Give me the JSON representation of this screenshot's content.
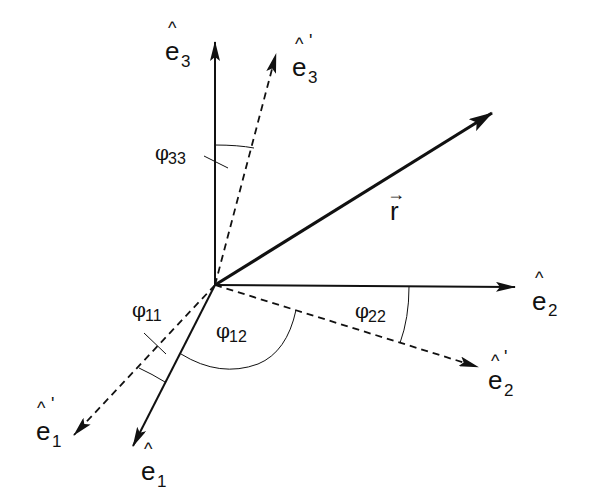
{
  "diagram": {
    "title": "",
    "origin": [
      215,
      285
    ],
    "vectors": [
      {
        "id": "e3",
        "label": "e",
        "subscript": "3",
        "hat": "^",
        "prime": "",
        "style": "solid",
        "tip": [
          215,
          40
        ]
      },
      {
        "id": "e3p",
        "label": "e",
        "subscript": "3",
        "hat": "^",
        "prime": "'",
        "style": "dashed",
        "tip": [
          277,
          52
        ]
      },
      {
        "id": "r",
        "label": "r",
        "arrow": "→",
        "style": "bold",
        "tip": [
          494,
          112
        ]
      },
      {
        "id": "e2",
        "label": "e",
        "subscript": "2",
        "hat": "^",
        "prime": "",
        "style": "solid",
        "tip": [
          517,
          287
        ]
      },
      {
        "id": "e2p",
        "label": "e",
        "subscript": "2",
        "hat": "^",
        "prime": "'",
        "style": "dashed",
        "tip": [
          480,
          368
        ]
      },
      {
        "id": "e1",
        "label": "e",
        "subscript": "1",
        "hat": "^",
        "prime": "",
        "style": "solid",
        "tip": [
          132,
          448
        ]
      },
      {
        "id": "e1p",
        "label": "e",
        "subscript": "1",
        "hat": "^",
        "prime": "'",
        "style": "dashed",
        "tip": [
          72,
          437
        ]
      }
    ],
    "angles": [
      {
        "id": "phi33",
        "symbol": "φ",
        "subscript": "33",
        "between": [
          "e3",
          "e3p"
        ]
      },
      {
        "id": "phi22",
        "symbol": "φ",
        "subscript": "22",
        "between": [
          "e2",
          "e2p"
        ]
      },
      {
        "id": "phi11",
        "symbol": "φ",
        "subscript": "11",
        "between": [
          "e1",
          "e1p"
        ]
      },
      {
        "id": "phi12",
        "symbol": "φ",
        "subscript": "12",
        "between": [
          "e1",
          "e2p"
        ]
      }
    ]
  }
}
